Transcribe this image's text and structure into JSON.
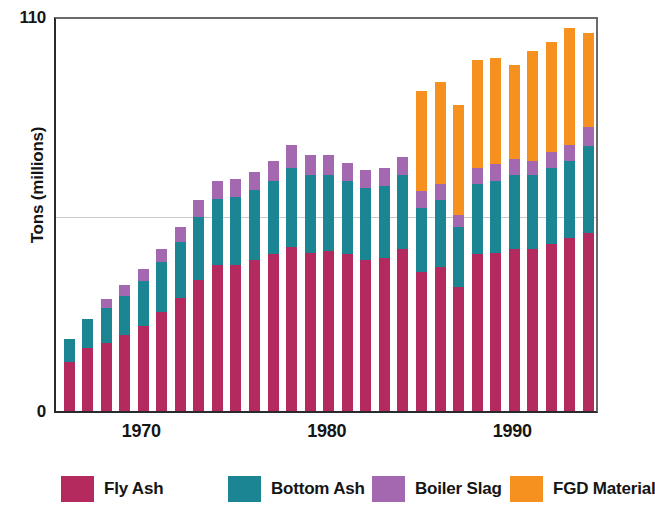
{
  "chart_data": {
    "type": "bar",
    "subtype": "stacked-bar",
    "title": "",
    "xlabel": "",
    "ylabel": "Tons (millions)",
    "ylim": [
      0,
      110
    ],
    "y_ticks": [
      "0",
      "110"
    ],
    "y_gridlines": [
      55
    ],
    "grid": true,
    "legend_position": "bottom",
    "x_tick_labels": [
      "1970",
      "1980",
      "1990"
    ],
    "categories": [
      "1966",
      "1967",
      "1968",
      "1969",
      "1970",
      "1971",
      "1972",
      "1973",
      "1974",
      "1975",
      "1976",
      "1977",
      "1978",
      "1979",
      "1980",
      "1981",
      "1982",
      "1983",
      "1984",
      "1985",
      "1986",
      "1987",
      "1988",
      "1989",
      "1990",
      "1991",
      "1992",
      "1993",
      "1994"
    ],
    "series": [
      {
        "name": "Fly Ash",
        "color": "#B42A5E",
        "values": [
          13.5,
          17.5,
          19.0,
          21.0,
          23.5,
          27.5,
          31.5,
          36.5,
          40.5,
          40.5,
          42.0,
          43.5,
          45.5,
          44.0,
          44.5,
          43.5,
          42.0,
          42.5,
          45.0,
          38.5,
          40.0,
          34.5,
          43.5,
          44.0,
          45.0,
          45.0,
          46.5,
          48.0,
          49.5
        ]
      },
      {
        "name": "Bottom Ash",
        "color": "#1B8593",
        "values": [
          6.5,
          8.0,
          9.5,
          11.0,
          12.5,
          14.0,
          15.5,
          17.5,
          18.5,
          19.0,
          19.5,
          20.5,
          22.0,
          21.5,
          21.0,
          20.5,
          20.0,
          20.0,
          20.5,
          18.0,
          18.5,
          16.5,
          19.5,
          20.0,
          20.5,
          20.5,
          21.0,
          21.5,
          24.0
        ]
      },
      {
        "name": "Boiler Slag",
        "color": "#A468B0",
        "values": [
          0.0,
          0.0,
          2.5,
          3.0,
          3.5,
          3.5,
          4.0,
          4.5,
          5.0,
          5.0,
          5.0,
          5.5,
          6.5,
          5.5,
          5.5,
          5.0,
          5.0,
          5.0,
          5.0,
          4.5,
          4.5,
          3.5,
          4.5,
          4.5,
          4.5,
          4.0,
          4.5,
          4.5,
          5.5
        ]
      },
      {
        "name": "FGD Material",
        "color": "#F6901E",
        "values": [
          0.0,
          0.0,
          0.0,
          0.0,
          0.0,
          0.0,
          0.0,
          0.0,
          0.0,
          0.0,
          0.0,
          0.0,
          0.0,
          0.0,
          0.0,
          0.0,
          0.0,
          0.0,
          0.0,
          28.0,
          28.5,
          30.5,
          30.0,
          29.5,
          26.0,
          30.5,
          30.5,
          32.5,
          26.0
        ]
      }
    ]
  },
  "axes": {
    "y_title": "Tons (millions)",
    "y_top_label": "110",
    "y_zero_label": "0"
  },
  "legend": {
    "items": [
      {
        "label": "Fly Ash",
        "color": "#B42A5E"
      },
      {
        "label": "Bottom Ash",
        "color": "#1B8593"
      },
      {
        "label": "Boiler Slag",
        "color": "#A468B0"
      },
      {
        "label": "FGD Material",
        "color": "#F6901E"
      }
    ]
  }
}
